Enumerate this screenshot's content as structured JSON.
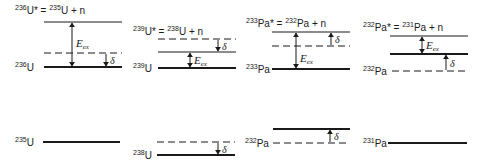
{
  "figure": {
    "type": "nuclear-energy-level-diagram",
    "colors": {
      "ink": "#1a1a1a",
      "background": "#ffffff"
    },
    "symbols": {
      "excitation_energy": "E",
      "excitation_sub": "ex",
      "pairing": "δ"
    }
  },
  "panels": [
    {
      "id": "u236",
      "header": {
        "compound_mass": "236",
        "compound_el": "U*",
        "eq": "=",
        "target_mass": "235",
        "target_el": "U",
        "plus": "+",
        "neutron": "n"
      },
      "header_pos": {
        "x": 15,
        "y": 14
      },
      "levels": [
        {
          "role": "separation",
          "y": 22,
          "x1": 44,
          "x2": 122,
          "style": "solid",
          "weight": 1.2
        },
        {
          "role": "pairing-shift",
          "y": 53,
          "x1": 44,
          "x2": 122,
          "style": "dashed",
          "weight": 1.2
        },
        {
          "role": "ground",
          "y": 67,
          "x1": 44,
          "x2": 122,
          "style": "solid",
          "weight": 2,
          "label_mass": "236",
          "label_el": "U",
          "label_x": 15
        }
      ],
      "eex_arrow": {
        "x": 72,
        "y1": 22,
        "y2": 67,
        "label_y": 47
      },
      "delta_arrow": {
        "x": 106,
        "y_from": 53,
        "y_to": 67,
        "dir": "down"
      },
      "isolated": {
        "y": 142,
        "x1": 43,
        "x2": 120,
        "style": "solid",
        "weight": 2,
        "label_mass": "235",
        "label_el": "U",
        "label_x": 15
      }
    },
    {
      "id": "u239",
      "header": {
        "compound_mass": "239",
        "compound_el": "U*",
        "eq": "=",
        "target_mass": "238",
        "target_el": "U",
        "plus": "+",
        "neutron": "n"
      },
      "header_pos": {
        "x": 133,
        "y": 35
      },
      "levels": [
        {
          "role": "separation",
          "y": 39,
          "x1": 158,
          "x2": 236,
          "style": "dashed",
          "weight": 1.2
        },
        {
          "role": "pairing-shift",
          "y": 52,
          "x1": 158,
          "x2": 236,
          "style": "solid",
          "weight": 1.2
        },
        {
          "role": "ground",
          "y": 68,
          "x1": 158,
          "x2": 236,
          "style": "solid",
          "weight": 2,
          "label_mass": "239",
          "label_el": "U",
          "label_x": 133
        }
      ],
      "eex_arrow": {
        "x": 190,
        "y1": 52,
        "y2": 68,
        "label_y": 64
      },
      "delta_arrow": {
        "x": 218,
        "y_from": 39,
        "y_to": 52,
        "dir": "down"
      },
      "isolated_pair": {
        "dashed": {
          "y": 142,
          "x1": 157,
          "x2": 235
        },
        "solid": {
          "y": 155,
          "x1": 157,
          "x2": 235,
          "weight": 1.8
        },
        "delta_arrow": {
          "x": 218,
          "y_from": 142,
          "y_to": 155,
          "dir": "down"
        },
        "label_mass": "238",
        "label_el": "U",
        "label_x": 133,
        "label_y": 159
      }
    },
    {
      "id": "pa233",
      "header": {
        "compound_mass": "233",
        "compound_el": "Pa*",
        "eq": "=",
        "target_mass": "232",
        "target_el": "Pa",
        "plus": "+",
        "neutron": "n"
      },
      "header_pos": {
        "x": 246,
        "y": 27
      },
      "levels": [
        {
          "role": "separation",
          "y": 32,
          "x1": 272,
          "x2": 350,
          "style": "solid",
          "weight": 1.2
        },
        {
          "role": "pairing-shift",
          "y": 46,
          "x1": 272,
          "x2": 350,
          "style": "dashed",
          "weight": 1.2
        },
        {
          "role": "ground",
          "y": 69,
          "x1": 272,
          "x2": 350,
          "style": "solid",
          "weight": 2,
          "label_mass": "233",
          "label_el": "Pa",
          "label_x": 246
        }
      ],
      "eex_arrow": {
        "x": 296,
        "y1": 32,
        "y2": 69,
        "label_y": 62
      },
      "delta_arrow": {
        "x": 331,
        "y_from": 46,
        "y_to": 32,
        "dir": "up"
      },
      "isolated_pair": {
        "solid": {
          "y": 129,
          "x1": 273,
          "x2": 350,
          "weight": 1.8
        },
        "dashed": {
          "y": 143,
          "x1": 273,
          "x2": 350
        },
        "delta_arrow": {
          "x": 330,
          "y_from": 143,
          "y_to": 129,
          "dir": "up"
        },
        "label_mass": "232",
        "label_el": "Pa",
        "label_x": 245,
        "label_y": 147
      }
    },
    {
      "id": "pa232",
      "header": {
        "compound_mass": "232",
        "compound_el": "Pa*",
        "eq": "=",
        "target_mass": "231",
        "target_el": "Pa",
        "plus": "+",
        "neutron": "n"
      },
      "header_pos": {
        "x": 363,
        "y": 31
      },
      "levels": [
        {
          "role": "separation",
          "y": 36,
          "x1": 390,
          "x2": 468,
          "style": "solid",
          "weight": 1.2
        },
        {
          "role": "pairing-shift",
          "y": 54,
          "x1": 390,
          "x2": 468,
          "style": "solid",
          "weight": 2
        },
        {
          "role": "ground",
          "y": 71,
          "x1": 392,
          "x2": 468,
          "style": "dashed",
          "weight": 1.2,
          "label_mass": "232",
          "label_el": "Pa",
          "label_x": 363
        }
      ],
      "eex_arrow": {
        "x": 422,
        "y1": 36,
        "y2": 54,
        "label_y": 49
      },
      "delta_arrow": {
        "x": 446,
        "y_from": 71,
        "y_to": 54,
        "dir": "up"
      },
      "isolated": {
        "y": 143,
        "x1": 388,
        "x2": 467,
        "style": "solid",
        "weight": 2,
        "label_mass": "231",
        "label_el": "Pa",
        "label_x": 363
      }
    }
  ]
}
